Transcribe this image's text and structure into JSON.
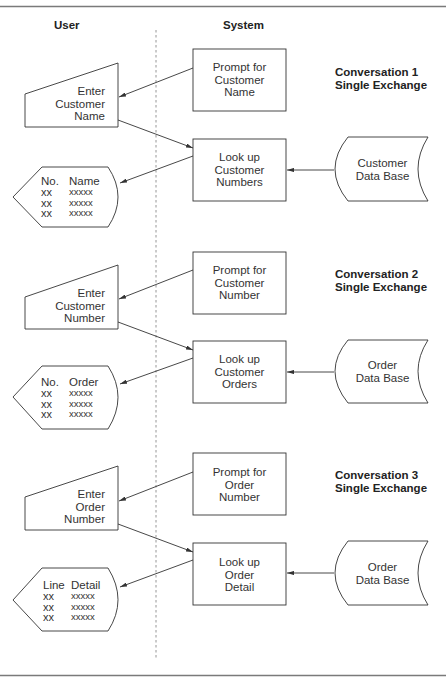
{
  "diagram": {
    "title_visible": "",
    "lanes": {
      "user": "User",
      "system": "System"
    },
    "conversations": [
      {
        "label_line1": "Conversation 1",
        "label_line2": "Single Exchange",
        "prompt": [
          "Prompt for",
          "Customer",
          "Name"
        ],
        "input": [
          "Enter",
          "Customer",
          "Name"
        ],
        "lookup": [
          "Look up",
          "Customer",
          "Numbers"
        ],
        "database": [
          "Customer",
          "Data Base"
        ],
        "display": {
          "col1_header": "No.",
          "col2_header": "Name",
          "rows": [
            [
              "xx",
              "xxxxx"
            ],
            [
              "xx",
              "xxxxx"
            ],
            [
              "xx",
              "xxxxx"
            ]
          ]
        }
      },
      {
        "label_line1": "Conversation 2",
        "label_line2": "Single Exchange",
        "prompt": [
          "Prompt for",
          "Customer",
          "Number"
        ],
        "input": [
          "Enter",
          "Customer",
          "Number"
        ],
        "lookup": [
          "Look up",
          "Customer",
          "Orders"
        ],
        "database": [
          "Order",
          "Data Base"
        ],
        "display": {
          "col1_header": "No.",
          "col2_header": "Order",
          "rows": [
            [
              "xx",
              "xxxxx"
            ],
            [
              "xx",
              "xxxxx"
            ],
            [
              "xx",
              "xxxxx"
            ]
          ]
        }
      },
      {
        "label_line1": "Conversation 3",
        "label_line2": "Single Exchange",
        "prompt": [
          "Prompt for",
          "Order",
          "Number"
        ],
        "input": [
          "Enter",
          "Order",
          "Number"
        ],
        "lookup": [
          "Look up",
          "Order",
          "Detail"
        ],
        "database": [
          "Order",
          "Data Base"
        ],
        "display": {
          "col1_header": "Line",
          "col2_header": "Detail",
          "rows": [
            [
              "xx",
              "xxxxx"
            ],
            [
              "xx",
              "xxxxx"
            ],
            [
              "xx",
              "xxxxx"
            ]
          ]
        }
      }
    ],
    "colors": {
      "stroke": "#333333",
      "rule": "#7a7a7a",
      "divider": "#8a8a8a",
      "background": "#ffffff"
    }
  }
}
